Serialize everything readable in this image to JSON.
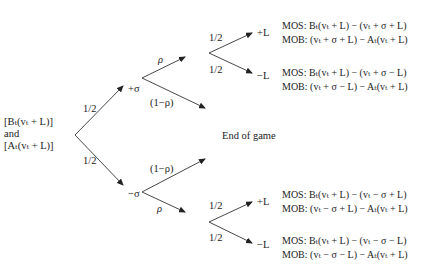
{
  "root": {
    "lines": [
      "[B_t(v_t + L)]",
      "and",
      "[A_t(v_t + L)]"
    ],
    "lines_display": [
      "[Bₜ(vₜ + L)]",
      "and",
      "[Aₜ(vₜ + L)]"
    ]
  },
  "first_split": {
    "prob_up": "1/2",
    "prob_down": "1/2",
    "up_node": "+σ",
    "down_node": "−σ"
  },
  "up_branch": {
    "prob_continue": "ρ",
    "prob_end": "(1−ρ)",
    "prob_plus": "1/2",
    "prob_minus": "1/2",
    "outcome_plus": "+L",
    "outcome_minus": "−L"
  },
  "down_branch": {
    "prob_end": "(1−ρ)",
    "prob_continue": "ρ",
    "prob_plus": "1/2",
    "prob_minus": "1/2",
    "outcome_plus": "+L",
    "outcome_minus": "−L"
  },
  "end_label": "End of game",
  "payoffs": [
    {
      "mos": "MOS: Bₜ(vₜ + L) − (vₜ + σ + L)",
      "mob": "MOB: (vₜ + σ + L) − Aₜ(vₜ + L)"
    },
    {
      "mos": "MOS: Bₜ(vₜ + L) − (vₜ + σ − L)",
      "mob": "MOB: (vₜ + σ − L) − Aₜ(vₜ + L)"
    },
    {
      "mos": "MOS: Bₜ(vₜ + L) − (vₜ − σ + L)",
      "mob": "MOB: (vₜ − σ + L) − Aₜ(vₜ + L)"
    },
    {
      "mos": "MOS: Bₜ(vₜ + L) − (vₜ − σ − L)",
      "mob": "MOB: (vₜ − σ − L) − Aₜ(vₜ + L)"
    }
  ]
}
